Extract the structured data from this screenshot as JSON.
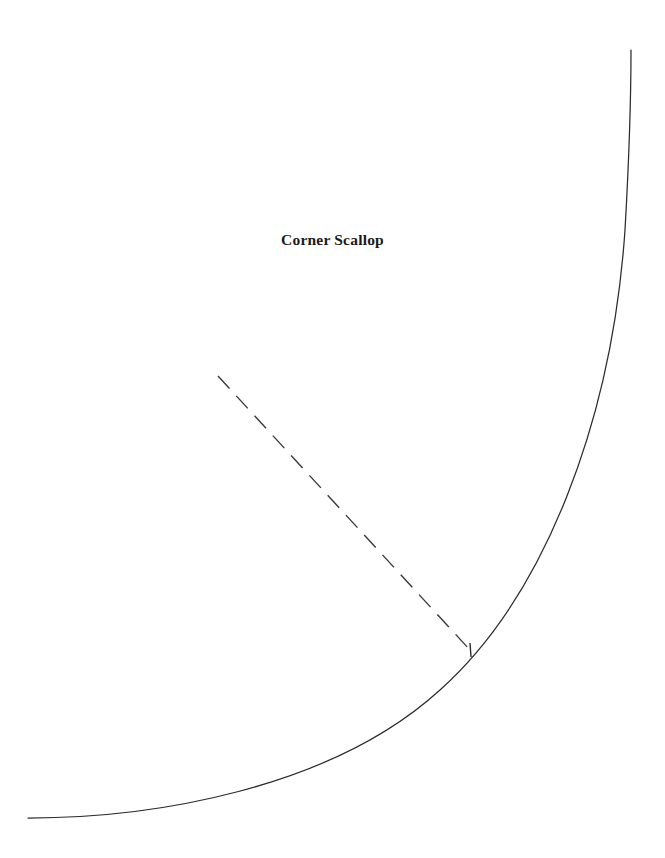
{
  "page": {
    "background_color": "#ffffff",
    "width": 665,
    "height": 858
  },
  "title": {
    "text": "Corner Scallop",
    "color": "#1a1a1a",
    "x": 342,
    "y": 243
  },
  "chart_data": {
    "type": "line",
    "title": "Corner Scallop",
    "subtitle": "",
    "xlabel": "",
    "ylabel": "",
    "grid": false,
    "legend": null,
    "xlim": [
      0,
      665
    ],
    "ylim": [
      858,
      0
    ],
    "annotations": [],
    "series": [
      {
        "name": "scallop-curve",
        "style": "solid",
        "color": "#2b2b2b",
        "width": 1.25,
        "description": "Concave quarter-arc sweeping from a horizontal tangent at the lower left to a vertical tangent at the upper right.",
        "path": "M 28 818 C 150 818 330 790 440 690 C 545 596 612 420 625 230 C 629 160 631 100 631 50",
        "points": [
          [
            28,
            818
          ],
          [
            90,
            817
          ],
          [
            150,
            814
          ],
          [
            210,
            806
          ],
          [
            270,
            791
          ],
          [
            330,
            768
          ],
          [
            390,
            733
          ],
          [
            440,
            692
          ],
          [
            470,
            650
          ],
          [
            505,
            608
          ],
          [
            540,
            560
          ],
          [
            565,
            512
          ],
          [
            590,
            450
          ],
          [
            607,
            390
          ],
          [
            618,
            330
          ],
          [
            625,
            270
          ],
          [
            629,
            200
          ],
          [
            631,
            130
          ],
          [
            631,
            50
          ]
        ]
      },
      {
        "name": "radius-guide-line",
        "style": "dashed",
        "color": "#3a3a3a",
        "width": 1.4,
        "dash_length": 17,
        "gap_length": 10,
        "description": "Dashed construction line running down-right from open end to the curve, terminating at the tick mark.",
        "points": [
          [
            218,
            376
          ],
          [
            470,
            650
          ]
        ]
      },
      {
        "name": "tangent-tick-mark",
        "style": "solid",
        "color": "#2b2b2b",
        "width": 1.4,
        "description": "Short near-vertical tick crossing the curve where the dashed line meets it.",
        "points": [
          [
            470,
            643
          ],
          [
            471,
            657
          ]
        ]
      }
    ]
  }
}
